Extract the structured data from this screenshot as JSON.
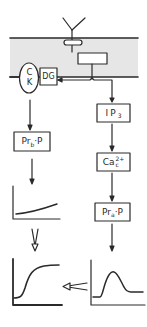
{
  "figure": {
    "colors": {
      "line": "#2a2a2a",
      "membrane_fill": "#e6e6e6",
      "background": "#ffffff"
    },
    "receptor": {
      "icon": "receptor-y-icon"
    },
    "membrane": {
      "label": ""
    },
    "ck": {
      "line1": "C",
      "line2": "K"
    },
    "dg": {
      "label": "DG"
    },
    "ip3": {
      "main": "IP",
      "sub": "3"
    },
    "ca": {
      "main": "Ca",
      "sup": "2+",
      "sub": "c"
    },
    "pra": {
      "main": "Pr",
      "sub": "a",
      "tail": "·P"
    },
    "prb": {
      "main": "Pr",
      "sub": "b",
      "tail": "·P"
    },
    "graphs": {
      "small_left": {
        "shape": "slow-rise"
      },
      "sigmoid": {
        "shape": "sigmoid"
      },
      "peak": {
        "shape": "transient-peak"
      }
    }
  }
}
